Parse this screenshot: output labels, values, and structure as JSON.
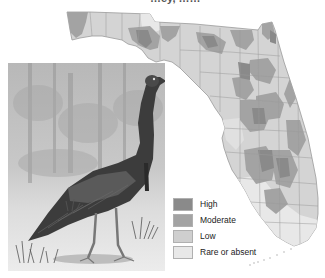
{
  "title": {
    "text": "Wild Turkey Density in Florida",
    "visible_fragment": "…ey, ……"
  },
  "map": {
    "region": "Florida",
    "subject": "Wild turkey abundance",
    "style": "grayscale shaded county map"
  },
  "illustration": {
    "subject": "Wild turkey (Osceola) standing in grass with forest background",
    "style": "grayscale painting"
  },
  "legend": {
    "items": [
      {
        "label": "High",
        "color": "#8a8a8a"
      },
      {
        "label": "Moderate",
        "color": "#a3a3a3"
      },
      {
        "label": "Low",
        "color": "#cfcfcf"
      },
      {
        "label": "Rare or absent",
        "color": "#e8e8e8"
      }
    ]
  },
  "colors": {
    "high": "#8a8a8a",
    "moderate": "#a3a3a3",
    "low": "#cfcfcf",
    "rare": "#e8e8e8",
    "borders": "#9a9a9a"
  }
}
